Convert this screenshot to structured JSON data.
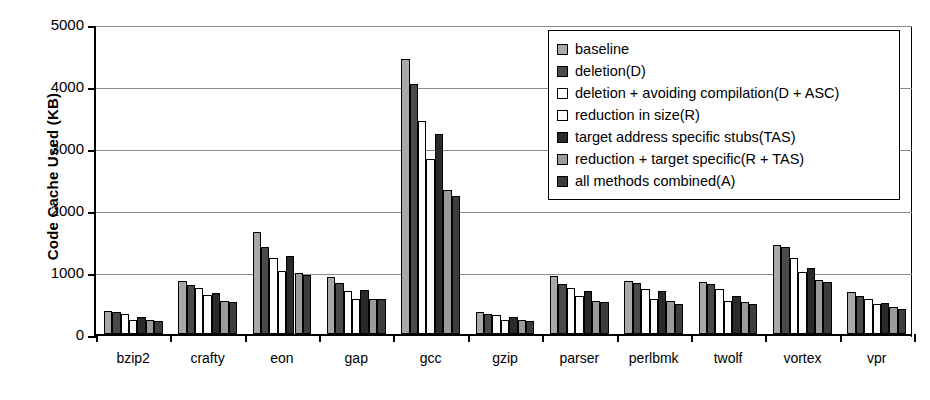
{
  "chart_data": {
    "type": "bar",
    "title": "",
    "xlabel": "",
    "ylabel": "Code Cache Used (KB)",
    "ylim": [
      0,
      5000
    ],
    "yticks": [
      0,
      1000,
      2000,
      3000,
      4000,
      5000
    ],
    "ytick_labels": [
      "0",
      "1000",
      "2000",
      "3000",
      "4000",
      "5000"
    ],
    "grid": true,
    "legend_position": "top-right",
    "categories": [
      "bzip2",
      "crafty",
      "eon",
      "gap",
      "gcc",
      "gzip",
      "parser",
      "perlbmk",
      "twolf",
      "vortex",
      "vpr"
    ],
    "series": [
      {
        "name": "baseline",
        "color": "#a8a8a8",
        "values": [
          370,
          860,
          1640,
          920,
          4430,
          350,
          930,
          860,
          840,
          1430,
          680
        ]
      },
      {
        "name": "deletion(D)",
        "color": "#4a4a4a",
        "values": [
          350,
          790,
          1410,
          820,
          4030,
          330,
          800,
          820,
          800,
          1400,
          620
        ]
      },
      {
        "name": "deletion + avoiding compilation(D + ASC)",
        "color": "#ffffff",
        "values": [
          330,
          740,
          1230,
          700,
          3430,
          310,
          750,
          730,
          720,
          1220,
          570
        ]
      },
      {
        "name": "reduction in size(R)",
        "color": "#fbfbfb",
        "values": [
          230,
          630,
          1020,
          570,
          2830,
          230,
          620,
          560,
          540,
          1000,
          480
        ]
      },
      {
        "name": "target address specific stubs(TAS)",
        "color": "#2a2a2a",
        "values": [
          280,
          660,
          1260,
          710,
          3220,
          270,
          700,
          690,
          620,
          1060,
          500
        ]
      },
      {
        "name": "reduction + target specific(R + TAS)",
        "color": "#9a9a9a",
        "values": [
          220,
          540,
          980,
          570,
          2330,
          220,
          540,
          540,
          510,
          870,
          430
        ]
      },
      {
        "name": "all methods combined(A)",
        "color": "#3d3d3d",
        "values": [
          215,
          520,
          950,
          560,
          2220,
          210,
          510,
          480,
          480,
          840,
          400
        ]
      }
    ]
  },
  "axis": {
    "y_title": "Code Cache Used (KB)"
  }
}
